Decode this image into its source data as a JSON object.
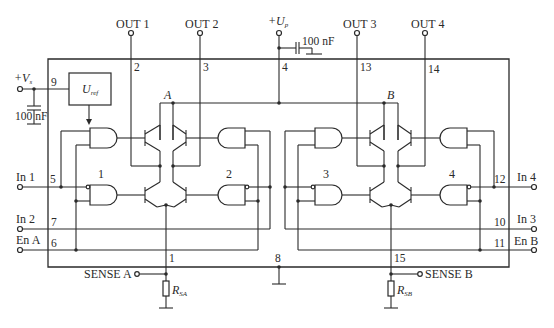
{
  "diagram": {
    "outputs": [
      {
        "label": "OUT 1",
        "pin": "2"
      },
      {
        "label": "OUT 2",
        "pin": "3"
      },
      {
        "label": "OUT 3",
        "pin": "13"
      },
      {
        "label": "OUT 4",
        "pin": "14"
      }
    ],
    "supply_power": {
      "label": "+U",
      "sub": "p",
      "pin": "4",
      "capacitor": "100 nF"
    },
    "supply_logic": {
      "label": "+V",
      "sub": "s",
      "pin": "9",
      "capacitor": "100 nF"
    },
    "regulator": {
      "label": "U",
      "sub": "ref"
    },
    "nodes": {
      "a": "A",
      "b": "B"
    },
    "gate_groups": [
      "1",
      "2",
      "3",
      "4"
    ],
    "inputs_left": [
      {
        "label": "In 1",
        "pin": "5"
      },
      {
        "label": "In 2",
        "pin": "7"
      },
      {
        "label": "En A",
        "pin": "6"
      }
    ],
    "inputs_right": [
      {
        "label": "In 4",
        "pin": "12"
      },
      {
        "label": "In 3",
        "pin": "10"
      },
      {
        "label": "En B",
        "pin": "11"
      }
    ],
    "sense": [
      {
        "label": "SENSE A",
        "pin": "1",
        "resistor": "R",
        "resistor_sub": "SA"
      },
      {
        "label": "SENSE B",
        "pin": "15",
        "resistor": "R",
        "resistor_sub": "SB"
      }
    ],
    "ground": {
      "pin": "8"
    },
    "colors": {
      "line": "#2a2a2a",
      "background": "#ffffff"
    }
  }
}
